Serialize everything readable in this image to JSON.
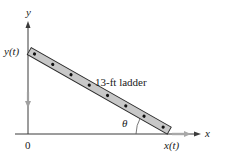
{
  "diagram": {
    "axes": {
      "x_label": "x",
      "y_label": "y",
      "origin_label": "0"
    },
    "ladder": {
      "label": "13-ft ladder",
      "top_label": "y(t)",
      "bottom_label": "x(t)",
      "angle_label": "θ",
      "dot_count": 8
    },
    "motion": {
      "top": "down",
      "bottom": "right"
    },
    "colors": {
      "axis": "#3a3a3a",
      "ladder_fill": "#c8c8c8",
      "ladder_stroke": "#2a2a2a",
      "dot": "#111111",
      "motion_arrow": "#9a9a9a"
    }
  }
}
